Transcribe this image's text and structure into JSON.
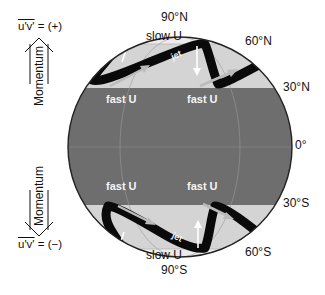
{
  "figure": {
    "latitudes": {
      "n90": "90°N",
      "n60": "60°N",
      "n30": "30°N",
      "eq": "0°",
      "s30": "30°S",
      "s60": "60°S",
      "s90": "90°S"
    },
    "regions": {
      "north_pole": "slow U",
      "south_pole": "slow U",
      "north_fast": [
        "fast U",
        "fast U"
      ],
      "south_fast": [
        "fast U",
        "fast U"
      ],
      "north_jet": "jet",
      "south_jet": "jet"
    },
    "left_panel": {
      "top_flux": "u'v'",
      "top_sign": " = (+)",
      "top_arrow_label": "Momentum",
      "bottom_flux": "u'v'",
      "bottom_sign": " = (−)",
      "bottom_arrow_label": "Momentum"
    },
    "colors": {
      "tropics_band": "#6e6e6e",
      "midlat_band": "#d4d4d4",
      "polar_cap": "#ebebeb",
      "jet": "#0a0a0a",
      "outline": "#222222"
    }
  }
}
